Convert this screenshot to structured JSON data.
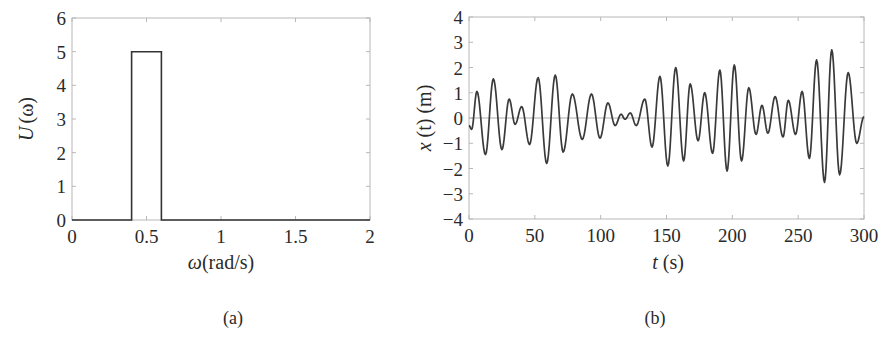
{
  "figure": {
    "panel_a": {
      "caption": "(a)",
      "ylabel_var": "U",
      "ylabel_arg": "(ω)",
      "xlabel_var": "ω",
      "xlabel_unit": "(rad/s)"
    },
    "panel_b": {
      "caption": "(b)",
      "ylabel_var": "x",
      "ylabel_rest": " (t) (m)",
      "xlabel_var": "t",
      "xlabel_unit": " (s)"
    }
  },
  "chart_data": [
    {
      "type": "line",
      "title": "",
      "panel": "(a)",
      "xlabel": "ω(rad/s)",
      "ylabel": "U(ω)",
      "xlim": [
        0,
        2
      ],
      "ylim": [
        0,
        6
      ],
      "xticks": [
        "0",
        "0.5",
        "1",
        "1.5",
        "2"
      ],
      "yticks": [
        "0",
        "1",
        "2",
        "3",
        "4",
        "5",
        "6"
      ],
      "grid": false,
      "series": [
        {
          "name": "U(ω)",
          "x": [
            0,
            0.4,
            0.4,
            0.6,
            0.6,
            2
          ],
          "y": [
            0,
            0,
            5,
            5,
            0,
            0
          ]
        }
      ],
      "description": "Rectangular (band-limited) spectrum: U = 5 for 0.4 ≤ ω ≤ 0.6 rad/s, 0 elsewhere"
    },
    {
      "type": "line",
      "title": "",
      "panel": "(b)",
      "xlabel": "t (s)",
      "ylabel": "x (t) (m)",
      "xlim": [
        0,
        300
      ],
      "ylim": [
        -4,
        4
      ],
      "xticks": [
        "0",
        "50",
        "100",
        "150",
        "200",
        "250",
        "300"
      ],
      "yticks": [
        "-4",
        "-3",
        "-2",
        "-1",
        "0",
        "1",
        "2",
        "3",
        "4"
      ],
      "grid": false,
      "zero_line": true,
      "series": [
        {
          "name": "x(t)",
          "extrema_t": [
            0,
            2,
            6,
            12.5,
            18.5,
            25,
            30.5,
            35,
            40,
            46,
            52.5,
            59,
            65.5,
            71.5,
            78.5,
            86,
            93,
            99.5,
            105.5,
            111,
            115.5,
            118.5,
            122.5,
            127,
            133.5,
            139,
            145,
            151,
            157,
            163,
            168,
            174,
            179,
            185,
            190.5,
            196,
            201.5,
            207,
            212.5,
            218,
            222.5,
            227,
            232.5,
            238.5,
            242.5,
            248,
            253,
            258.5,
            264,
            270,
            275.5,
            281.5,
            288,
            294.5,
            300
          ],
          "extrema_x": [
            -0.3,
            -0.45,
            1.05,
            -1.45,
            1.55,
            -1.25,
            0.75,
            -0.25,
            0.45,
            -1.05,
            1.6,
            -1.8,
            1.7,
            -1.35,
            0.95,
            -0.85,
            0.95,
            -0.8,
            0.6,
            -0.3,
            0.15,
            -0.05,
            0.2,
            -0.3,
            0.75,
            -1.15,
            1.65,
            -1.9,
            2.0,
            -1.7,
            1.35,
            -0.9,
            1.0,
            -1.4,
            1.9,
            -2.1,
            2.1,
            -1.7,
            1.2,
            -0.65,
            0.5,
            -0.6,
            0.85,
            -0.75,
            0.7,
            -0.65,
            1.05,
            -1.6,
            2.3,
            -2.55,
            2.7,
            -2.25,
            1.8,
            -1.0,
            0.05
          ]
        }
      ],
      "description": "Random wave displacement time series, narrow-band around ω≈0.5 rad/s (period ≈ 12 s), amplitude up to ≈ ±2.7 m"
    }
  ]
}
